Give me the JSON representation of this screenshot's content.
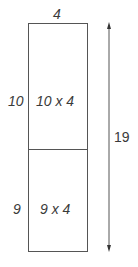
{
  "diagram": {
    "top_width_label": "4",
    "sections": [
      {
        "side_label": "10",
        "area_label": "10 x 4"
      },
      {
        "side_label": "9",
        "area_label": "9 x 4"
      }
    ],
    "total_length_label": "19"
  }
}
